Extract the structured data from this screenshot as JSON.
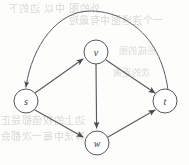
{
  "figure": {
    "type": "directed-graph",
    "caption": "",
    "background_color": "#fdfdfc",
    "node_stroke_color": "#58565a",
    "edge_color": "#5c5a5e",
    "label_color": "#3a383b"
  },
  "nodes": [
    {
      "id": "s",
      "label": "s",
      "cx": 26,
      "cy": 101,
      "r": 12
    },
    {
      "id": "v",
      "label": "v",
      "cx": 96,
      "cy": 52,
      "r": 12
    },
    {
      "id": "w",
      "label": "w",
      "cx": 97,
      "cy": 143,
      "r": 12
    },
    {
      "id": "t",
      "label": "t",
      "cx": 165,
      "cy": 101,
      "r": 12
    }
  ],
  "edges": [
    {
      "id": "s-v",
      "from": "s",
      "to": "v",
      "shape": "straight",
      "directed": true
    },
    {
      "id": "s-w",
      "from": "s",
      "to": "w",
      "shape": "straight",
      "directed": true
    },
    {
      "id": "v-w",
      "from": "v",
      "to": "w",
      "shape": "straight",
      "directed": true
    },
    {
      "id": "v-t",
      "from": "v",
      "to": "t",
      "shape": "straight",
      "directed": true
    },
    {
      "id": "w-t",
      "from": "w",
      "to": "t",
      "shape": "straight",
      "directed": true
    },
    {
      "id": "t-s",
      "from": "t",
      "to": "s",
      "shape": "curved-arc-over-top",
      "directed": true
    }
  ],
  "bleed_text": [
    {
      "text": "外的图 中以 边的下",
      "x": 8,
      "y": 6,
      "size": 10
    },
    {
      "text": "一个连通图中有最短",
      "x": 68,
      "y": 18,
      "size": 10
    },
    {
      "text": "形成的图",
      "x": 118,
      "y": 50,
      "size": 9
    },
    {
      "text": "次的距离",
      "x": 112,
      "y": 72,
      "size": 9
    },
    {
      "text": "边上的权值都是正",
      "x": 0,
      "y": 118,
      "size": 10
    },
    {
      "text": "算法中每一次都会",
      "x": 0,
      "y": 134,
      "size": 10
    }
  ]
}
